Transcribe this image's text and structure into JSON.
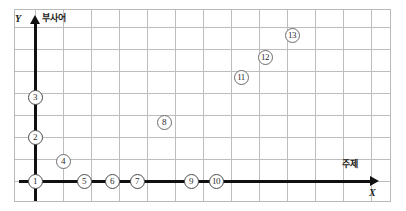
{
  "figure": {
    "type": "scatter-graph",
    "frame": {
      "x": 14,
      "y": 9,
      "width": 377,
      "height": 193
    },
    "colors": {
      "grid": "#bdbdbd",
      "axis": "#111111",
      "frame_border": "#b9b9b9",
      "marker_border": "#6d6d6d",
      "marker_fill": "#ffffff",
      "background": "#ffffff"
    }
  },
  "axes": {
    "y": {
      "letter": "Y",
      "name": "부사어",
      "arrow": "arrow-up"
    },
    "x": {
      "letter": "X",
      "name": "주제",
      "arrow": "arrow-right"
    }
  },
  "grid": {
    "column_count": 13,
    "row_count": 8,
    "column_spacing": 28,
    "row_spacing": 22,
    "visible": true
  },
  "chart_data": {
    "type": "scatter",
    "title": "",
    "xlabel": "주제",
    "ylabel": "부사어",
    "grid": true,
    "legend": "none",
    "xlim": [
      0,
      13
    ],
    "ylim": [
      0,
      8
    ],
    "point_labels": [
      "1",
      "2",
      "3",
      "4",
      "5",
      "6",
      "7",
      "8",
      "9",
      "10",
      "11",
      "12",
      "13"
    ],
    "points": [
      {
        "label": "1",
        "px": 34,
        "py": 180,
        "on_axis": "origin"
      },
      {
        "label": "2",
        "py": 136,
        "px": 34,
        "on_axis": "y"
      },
      {
        "label": "3",
        "px": 34,
        "py": 96,
        "on_axis": "y"
      },
      {
        "label": "4",
        "px": 62,
        "py": 160,
        "on_axis": "none"
      },
      {
        "label": "5",
        "px": 83,
        "py": 180,
        "on_axis": "x"
      },
      {
        "label": "6",
        "px": 111,
        "py": 180,
        "on_axis": "x"
      },
      {
        "label": "7",
        "px": 136,
        "py": 180,
        "on_axis": "x"
      },
      {
        "label": "8",
        "px": 163,
        "py": 121,
        "on_axis": "none"
      },
      {
        "label": "9",
        "px": 190,
        "py": 180,
        "on_axis": "x"
      },
      {
        "label": "10",
        "px": 215,
        "py": 180,
        "on_axis": "x"
      },
      {
        "label": "11",
        "px": 240,
        "py": 76,
        "on_axis": "none"
      },
      {
        "label": "12",
        "px": 264,
        "py": 56,
        "on_axis": "none"
      },
      {
        "label": "13",
        "px": 291,
        "py": 34,
        "on_axis": "none"
      }
    ]
  }
}
